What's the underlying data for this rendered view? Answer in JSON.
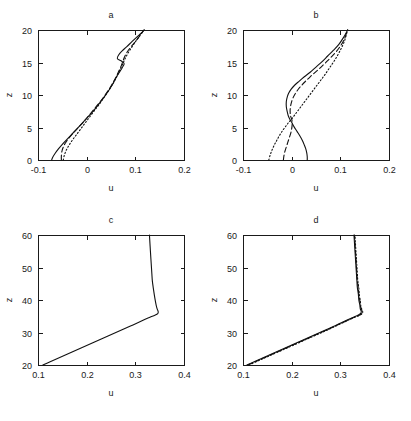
{
  "figure": {
    "background": "#ffffff",
    "line_color": "#111111",
    "panel_count": 4
  },
  "chart_data": [
    {
      "type": "line",
      "title": "a",
      "xlabel": "u",
      "ylabel": "z",
      "xlim": [
        -0.1,
        0.2
      ],
      "ylim": [
        0,
        20
      ],
      "xticks": [
        -0.1,
        0,
        0.1,
        0.2
      ],
      "xticklabels": [
        "-0.1",
        "0",
        "0.1",
        "0.2"
      ],
      "yticks": [
        0,
        5,
        10,
        15,
        20
      ],
      "yticklabels": [
        "0",
        "5",
        "10",
        "15",
        "20"
      ],
      "grid": false,
      "legend": "none",
      "series": [
        {
          "name": "solid",
          "style": "solid",
          "u": [
            -0.072,
            -0.07,
            -0.065,
            -0.058,
            -0.05,
            -0.04,
            -0.03,
            -0.02,
            -0.01,
            0.0,
            0.012,
            0.025,
            0.038,
            0.048,
            0.056,
            0.062,
            0.068,
            0.073,
            0.077,
            0.072,
            0.063,
            0.066,
            0.073,
            0.082,
            0.093,
            0.103,
            0.112,
            0.118
          ],
          "z": [
            0.0,
            0.4,
            1.0,
            1.7,
            2.4,
            3.2,
            4.0,
            4.8,
            5.6,
            6.4,
            7.4,
            8.6,
            9.9,
            11.0,
            12.0,
            12.9,
            13.6,
            14.2,
            14.8,
            15.2,
            15.6,
            16.2,
            16.8,
            17.4,
            18.2,
            18.9,
            19.5,
            20.0
          ]
        },
        {
          "name": "dashed",
          "style": "dashed",
          "u": [
            -0.052,
            -0.052,
            -0.051,
            -0.048,
            -0.043,
            -0.035,
            -0.026,
            -0.016,
            -0.006,
            0.004,
            0.015,
            0.027,
            0.038,
            0.047,
            0.054,
            0.06,
            0.065,
            0.07,
            0.074,
            0.078,
            0.084,
            0.092,
            0.101,
            0.11,
            0.118
          ],
          "z": [
            0.0,
            0.6,
            1.3,
            2.0,
            2.7,
            3.5,
            4.3,
            5.1,
            5.9,
            6.8,
            7.8,
            8.9,
            10.0,
            11.0,
            11.9,
            12.7,
            13.5,
            14.3,
            15.1,
            15.9,
            16.7,
            17.5,
            18.3,
            19.2,
            20.0
          ]
        },
        {
          "name": "dotted",
          "style": "dotted",
          "u": [
            -0.048,
            -0.046,
            -0.042,
            -0.036,
            -0.029,
            -0.021,
            -0.012,
            -0.003,
            0.007,
            0.018,
            0.029,
            0.039,
            0.048,
            0.055,
            0.061,
            0.066,
            0.071,
            0.076,
            0.081,
            0.087,
            0.094,
            0.102,
            0.11,
            0.118
          ],
          "z": [
            0.0,
            0.7,
            1.5,
            2.3,
            3.1,
            3.9,
            4.8,
            5.7,
            6.7,
            7.8,
            8.9,
            10.0,
            11.0,
            11.9,
            12.7,
            13.5,
            14.3,
            15.1,
            15.9,
            16.7,
            17.5,
            18.4,
            19.2,
            20.0
          ]
        }
      ]
    },
    {
      "type": "line",
      "title": "b",
      "xlabel": "u",
      "ylabel": "z",
      "xlim": [
        -0.1,
        0.2
      ],
      "ylim": [
        0,
        20
      ],
      "xticks": [
        -0.1,
        0,
        0.1,
        0.2
      ],
      "xticklabels": [
        "-0.1",
        "0",
        "0.1",
        "0.2"
      ],
      "yticks": [
        0,
        5,
        10,
        15,
        20
      ],
      "yticklabels": [
        "0",
        "5",
        "10",
        "15",
        "20"
      ],
      "grid": false,
      "legend": "none",
      "series": [
        {
          "name": "solid",
          "style": "solid",
          "u": [
            0.032,
            0.032,
            0.031,
            0.029,
            0.026,
            0.022,
            0.017,
            0.011,
            0.005,
            0.0,
            -0.004,
            -0.007,
            -0.009,
            -0.011,
            -0.011,
            -0.009,
            -0.006,
            -0.001,
            0.006,
            0.015,
            0.026,
            0.038,
            0.05,
            0.062,
            0.074,
            0.086,
            0.097,
            0.107,
            0.115
          ],
          "z": [
            0.0,
            0.5,
            1.1,
            1.7,
            2.3,
            3.0,
            3.7,
            4.4,
            5.1,
            5.8,
            6.3,
            6.8,
            7.4,
            8.2,
            9.0,
            9.7,
            10.3,
            10.9,
            11.5,
            12.1,
            12.8,
            13.5,
            14.3,
            15.1,
            16.0,
            16.9,
            17.8,
            18.9,
            20.0
          ]
        },
        {
          "name": "dashed",
          "style": "dashed",
          "u": [
            -0.017,
            -0.016,
            -0.014,
            -0.011,
            -0.008,
            -0.005,
            -0.002,
            0.0,
            0.001,
            0.001,
            0.0,
            -0.002,
            -0.003,
            -0.003,
            -0.001,
            0.003,
            0.009,
            0.017,
            0.027,
            0.038,
            0.05,
            0.062,
            0.074,
            0.086,
            0.097,
            0.107,
            0.115
          ],
          "z": [
            0.0,
            0.6,
            1.3,
            2.0,
            2.7,
            3.4,
            4.1,
            4.8,
            5.4,
            5.9,
            6.3,
            6.7,
            7.2,
            7.9,
            8.7,
            9.6,
            10.4,
            11.2,
            12.0,
            12.8,
            13.6,
            14.4,
            15.3,
            16.2,
            17.2,
            18.4,
            20.0
          ]
        },
        {
          "name": "dotted",
          "style": "dotted",
          "u": [
            -0.047,
            -0.044,
            -0.04,
            -0.035,
            -0.03,
            -0.024,
            -0.018,
            -0.012,
            -0.006,
            0.0,
            0.006,
            0.013,
            0.021,
            0.029,
            0.037,
            0.045,
            0.053,
            0.061,
            0.069,
            0.078,
            0.088,
            0.098,
            0.108,
            0.115
          ],
          "z": [
            0.0,
            0.8,
            1.6,
            2.4,
            3.1,
            3.9,
            4.6,
            5.2,
            5.8,
            6.3,
            6.9,
            7.6,
            8.4,
            9.2,
            10.0,
            10.8,
            11.6,
            12.4,
            13.2,
            14.2,
            15.3,
            16.6,
            18.2,
            20.0
          ]
        }
      ]
    },
    {
      "type": "line",
      "title": "c",
      "xlabel": "u",
      "ylabel": "z",
      "xlim": [
        0.1,
        0.4
      ],
      "ylim": [
        20,
        60
      ],
      "xticks": [
        0.1,
        0.2,
        0.3,
        0.4
      ],
      "xticklabels": [
        "0.1",
        "0.2",
        "0.3",
        "0.4"
      ],
      "yticks": [
        20,
        30,
        40,
        50,
        60
      ],
      "yticklabels": [
        "20",
        "30",
        "40",
        "50",
        "60"
      ],
      "grid": false,
      "legend": "none",
      "series": [
        {
          "name": "solid",
          "style": "solid",
          "u": [
            0.11,
            0.125,
            0.14,
            0.155,
            0.17,
            0.185,
            0.2,
            0.215,
            0.23,
            0.245,
            0.26,
            0.275,
            0.29,
            0.305,
            0.318,
            0.33,
            0.34,
            0.346,
            0.347,
            0.345,
            0.343,
            0.341,
            0.339,
            0.337,
            0.335,
            0.334,
            0.333,
            0.332,
            0.331,
            0.33,
            0.329
          ],
          "z": [
            20.0,
            21.0,
            22.0,
            23.0,
            24.0,
            25.0,
            26.0,
            27.0,
            28.0,
            29.0,
            30.0,
            31.0,
            32.0,
            33.0,
            33.9,
            34.7,
            35.3,
            35.8,
            36.4,
            37.2,
            38.3,
            39.8,
            41.6,
            43.6,
            45.8,
            48.0,
            50.3,
            52.6,
            55.0,
            57.5,
            60.0
          ]
        }
      ]
    },
    {
      "type": "line",
      "title": "d",
      "xlabel": "u",
      "ylabel": "z",
      "xlim": [
        0.1,
        0.4
      ],
      "ylim": [
        20,
        60
      ],
      "xticks": [
        0.1,
        0.2,
        0.3,
        0.4
      ],
      "xticklabels": [
        "0.1",
        "0.2",
        "0.3",
        "0.4"
      ],
      "yticks": [
        20,
        30,
        40,
        50,
        60
      ],
      "yticklabels": [
        "20",
        "30",
        "40",
        "50",
        "60"
      ],
      "grid": false,
      "legend": "none",
      "series": [
        {
          "name": "solid",
          "style": "solid",
          "u": [
            0.108,
            0.123,
            0.138,
            0.153,
            0.168,
            0.183,
            0.198,
            0.213,
            0.228,
            0.243,
            0.258,
            0.273,
            0.288,
            0.302,
            0.315,
            0.327,
            0.337,
            0.342,
            0.343,
            0.341,
            0.34,
            0.338,
            0.337,
            0.335,
            0.334,
            0.333,
            0.332,
            0.331,
            0.33,
            0.329,
            0.328
          ],
          "z": [
            20.0,
            21.0,
            22.0,
            23.0,
            24.0,
            25.0,
            26.0,
            27.0,
            28.0,
            29.0,
            30.0,
            31.0,
            32.0,
            33.0,
            33.9,
            34.7,
            35.4,
            35.9,
            36.5,
            37.3,
            38.5,
            40.0,
            41.8,
            43.8,
            46.0,
            48.3,
            50.6,
            53.0,
            55.3,
            57.7,
            60.0
          ]
        },
        {
          "name": "dashed",
          "style": "dashed",
          "u": [
            0.11,
            0.125,
            0.14,
            0.155,
            0.17,
            0.185,
            0.2,
            0.215,
            0.23,
            0.245,
            0.26,
            0.275,
            0.29,
            0.304,
            0.317,
            0.329,
            0.339,
            0.344,
            0.345,
            0.343,
            0.341,
            0.34,
            0.338,
            0.337,
            0.335,
            0.334,
            0.333,
            0.332,
            0.331,
            0.33,
            0.329
          ],
          "z": [
            20.0,
            21.0,
            22.0,
            23.0,
            24.0,
            25.0,
            26.0,
            27.0,
            28.0,
            29.0,
            30.0,
            31.0,
            32.0,
            33.0,
            33.9,
            34.7,
            35.3,
            35.8,
            36.4,
            37.2,
            38.4,
            39.9,
            41.7,
            43.7,
            45.9,
            48.2,
            50.5,
            52.9,
            55.2,
            57.6,
            60.0
          ]
        },
        {
          "name": "dotted",
          "style": "dotted",
          "u": [
            0.112,
            0.127,
            0.142,
            0.157,
            0.172,
            0.187,
            0.202,
            0.217,
            0.232,
            0.247,
            0.262,
            0.277,
            0.291,
            0.305,
            0.318,
            0.33,
            0.34,
            0.345,
            0.346,
            0.344,
            0.342,
            0.341,
            0.339,
            0.338,
            0.336,
            0.335,
            0.334,
            0.333,
            0.332,
            0.331,
            0.33
          ],
          "z": [
            20.0,
            21.0,
            22.0,
            23.0,
            24.0,
            25.0,
            26.0,
            27.0,
            28.0,
            29.0,
            30.0,
            31.0,
            32.0,
            33.0,
            33.9,
            34.7,
            35.3,
            35.8,
            36.4,
            37.2,
            38.3,
            39.8,
            41.6,
            43.6,
            45.8,
            48.1,
            50.4,
            52.8,
            55.1,
            57.5,
            60.0
          ]
        }
      ]
    }
  ]
}
